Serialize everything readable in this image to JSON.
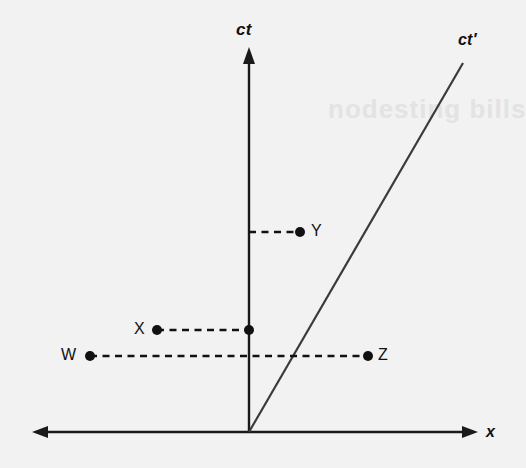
{
  "figure": {
    "kind": "minkowski-spacetime-diagram",
    "background_color": "#f2f2f2",
    "ink_color": "#111111",
    "watermark_text": "nodesting bills"
  },
  "axes": {
    "vertical": {
      "label": "ct",
      "name": "ct-axis",
      "x": 249,
      "top_y": 47,
      "bottom_y": 432,
      "arrow": "up",
      "label_x": 236,
      "label_y": 20
    },
    "horizontal": {
      "label": "x",
      "name": "x-axis",
      "y": 432,
      "left_x": 32,
      "right_x": 478,
      "arrow": "both",
      "label_x": 486,
      "label_y": 423
    },
    "origin": {
      "x": 249,
      "y": 432
    }
  },
  "worldline": {
    "label": "ct′",
    "name": "ct-prime-worldline",
    "from": {
      "x": 249,
      "y": 432
    },
    "to": {
      "x": 463,
      "y": 63
    },
    "label_x": 458,
    "label_y": 31
  },
  "events": [
    {
      "id": "Y",
      "label": "Y",
      "dot": {
        "x": 300,
        "y": 232
      },
      "label_x": 311,
      "label_y": 222,
      "link_from": {
        "x": 249,
        "y": 232
      },
      "link_to": {
        "x": 300,
        "y": 232
      }
    },
    {
      "id": "X",
      "label": "X",
      "dot": {
        "x": 157,
        "y": 330
      },
      "label_x": 134,
      "label_y": 320,
      "link_from": {
        "x": 157,
        "y": 330
      },
      "link_to": {
        "x": 249,
        "y": 330
      }
    },
    {
      "id": "W",
      "label": "W",
      "dot": {
        "x": 90,
        "y": 356
      },
      "label_x": 61,
      "label_y": 346,
      "link_from": {
        "x": 90,
        "y": 356
      },
      "link_to": {
        "x": 368,
        "y": 356
      }
    },
    {
      "id": "Z",
      "label": "Z",
      "dot": {
        "x": 368,
        "y": 356
      },
      "label_x": 378,
      "label_y": 346,
      "link_from": {
        "x": 368,
        "y": 356
      },
      "link_to": {
        "x": 368,
        "y": 356
      }
    }
  ],
  "axis_intersection_dots": [
    {
      "name": "x-event-on-ct-axis",
      "x": 249,
      "y": 330
    }
  ]
}
